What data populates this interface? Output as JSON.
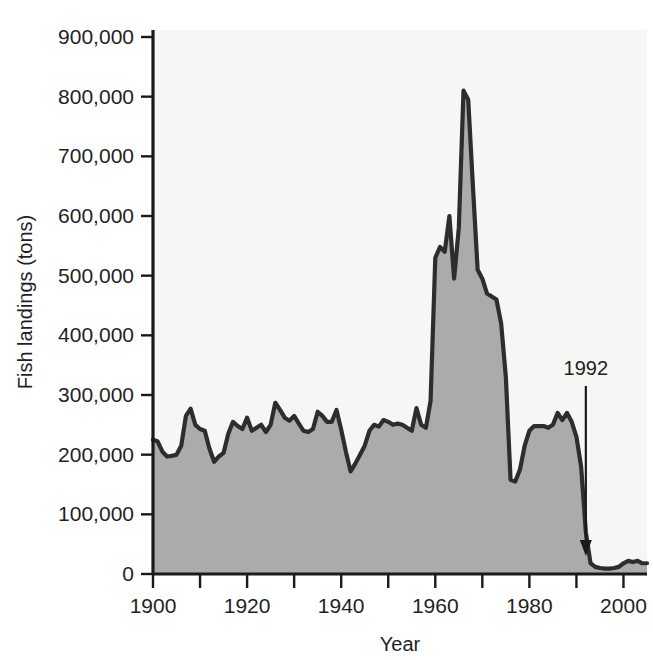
{
  "chart_data": {
    "type": "area",
    "title": "",
    "subtitle": "",
    "xlabel": "Year",
    "ylabel": "Fish landings (tons)",
    "xlim": [
      1900,
      2005
    ],
    "ylim": [
      0,
      900000
    ],
    "grid": false,
    "legend": false,
    "legend_position": "none",
    "x_tick_labels": [
      "1900",
      "1920",
      "1940",
      "1960",
      "1980",
      "2000"
    ],
    "x_tick_values": [
      1900,
      1920,
      1940,
      1960,
      1980,
      2000
    ],
    "x_minor_tick_values": [
      1910,
      1930,
      1950,
      1970,
      1990
    ],
    "y_tick_labels": [
      "0",
      "100,000",
      "200,000",
      "300,000",
      "400,000",
      "500,000",
      "600,000",
      "700,000",
      "800,000",
      "900,000"
    ],
    "y_tick_values": [
      0,
      100000,
      200000,
      300000,
      400000,
      500000,
      600000,
      700000,
      800000,
      900000
    ],
    "annotations": [
      {
        "text": "1992",
        "x": 1992,
        "y": 410000,
        "arrow_to_y": 30000,
        "style": "down-arrow"
      }
    ],
    "colors": {
      "area_fill": "#ababab",
      "line": "#2d2d2d",
      "plot_background": "#f6f6f4",
      "axis": "#1a1a1a",
      "text": "#1f1f1f"
    },
    "series": [
      {
        "name": "Fish landings",
        "x": [
          1900,
          1901,
          1902,
          1903,
          1904,
          1905,
          1906,
          1907,
          1908,
          1909,
          1910,
          1911,
          1912,
          1913,
          1914,
          1915,
          1916,
          1917,
          1918,
          1919,
          1920,
          1921,
          1922,
          1923,
          1924,
          1925,
          1926,
          1927,
          1928,
          1929,
          1930,
          1931,
          1932,
          1933,
          1934,
          1935,
          1936,
          1937,
          1938,
          1939,
          1940,
          1941,
          1942,
          1943,
          1944,
          1945,
          1946,
          1947,
          1948,
          1949,
          1950,
          1951,
          1952,
          1953,
          1954,
          1955,
          1956,
          1957,
          1958,
          1959,
          1960,
          1961,
          1962,
          1963,
          1964,
          1965,
          1966,
          1967,
          1968,
          1969,
          1970,
          1971,
          1972,
          1973,
          1974,
          1975,
          1976,
          1977,
          1978,
          1979,
          1980,
          1981,
          1982,
          1983,
          1984,
          1985,
          1986,
          1987,
          1988,
          1989,
          1990,
          1991,
          1992,
          1993,
          1994,
          1995,
          1996,
          1997,
          1998,
          1999,
          2000,
          2001,
          2002,
          2003,
          2004,
          2005
        ],
        "values": [
          225000,
          222000,
          205000,
          197000,
          198000,
          200000,
          215000,
          265000,
          277000,
          250000,
          243000,
          240000,
          210000,
          188000,
          197000,
          203000,
          235000,
          255000,
          248000,
          243000,
          262000,
          240000,
          245000,
          250000,
          238000,
          250000,
          287000,
          275000,
          262000,
          257000,
          265000,
          252000,
          240000,
          238000,
          243000,
          272000,
          265000,
          255000,
          255000,
          275000,
          242000,
          205000,
          172000,
          185000,
          200000,
          215000,
          240000,
          250000,
          247000,
          258000,
          255000,
          250000,
          252000,
          250000,
          245000,
          240000,
          278000,
          250000,
          245000,
          290000,
          530000,
          548000,
          540000,
          600000,
          495000,
          580000,
          810000,
          795000,
          650000,
          510000,
          495000,
          470000,
          465000,
          460000,
          420000,
          330000,
          158000,
          155000,
          175000,
          215000,
          240000,
          248000,
          248000,
          248000,
          245000,
          250000,
          270000,
          258000,
          270000,
          255000,
          230000,
          180000,
          70000,
          18000,
          12000,
          10000,
          9000,
          9000,
          10000,
          12000,
          18000,
          22000,
          20000,
          22000,
          18000,
          18000
        ]
      }
    ]
  },
  "axis": {
    "y_title": "Fish landings (tons)",
    "x_title": "Year"
  }
}
